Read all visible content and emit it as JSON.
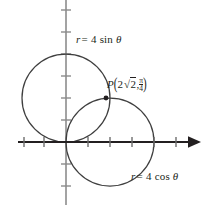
{
  "figure": {
    "type": "polar-graph",
    "background": "#ffffff",
    "axis_color": "#231f20",
    "yaxis_color": "#8c8c8c",
    "curve_color": "#3f3f3f",
    "text_color": "#231f20"
  },
  "axes": {
    "origin_px": [
      66,
      142
    ],
    "unit_px": 22,
    "x_axis": {
      "name": "x-axis",
      "from_px": [
        18,
        142
      ],
      "to_px": [
        200,
        142
      ],
      "arrow": "right",
      "ticks_px": [
        24,
        44,
        88,
        110,
        132,
        154,
        176
      ],
      "tick_half_len": 5
    },
    "y_axis": {
      "name": "y-axis",
      "from_px": [
        66,
        0
      ],
      "to_px": [
        66,
        205
      ],
      "arrow": "none",
      "ticks_px": [
        10,
        32,
        54,
        76,
        98,
        120,
        164,
        186
      ],
      "tick_half_len": 5
    }
  },
  "curves": [
    {
      "name": "circle-r-4-sin-theta",
      "equation": "r = 4 sin θ",
      "center_px": [
        66,
        98
      ],
      "radius_px": 44,
      "label": {
        "r": "r",
        "equals": "=",
        "value": "4",
        "func": "sin",
        "theta": "θ",
        "text": "r = 4 sin θ"
      }
    },
    {
      "name": "circle-r-4-cos-theta",
      "equation": "r = 4 cos θ",
      "center_px": [
        110,
        142
      ],
      "radius_px": 44,
      "label": {
        "r": "r",
        "equals": "=",
        "value": "4",
        "func": "cos",
        "theta": "θ",
        "text": "r = 4 cos θ"
      }
    }
  ],
  "point": {
    "name": "intersection-point-P",
    "label_letter": "P",
    "position_px": [
      106,
      98
    ],
    "polar_r": "2√2",
    "polar_r_coefficient": "2",
    "polar_r_radical": "2",
    "polar_theta_numerator": "π",
    "polar_theta_denominator": "4",
    "comma": ",",
    "open_paren": "(",
    "close_paren": ")",
    "text": "P(2√2, π/4)",
    "dot_radius_px": 2.4
  }
}
